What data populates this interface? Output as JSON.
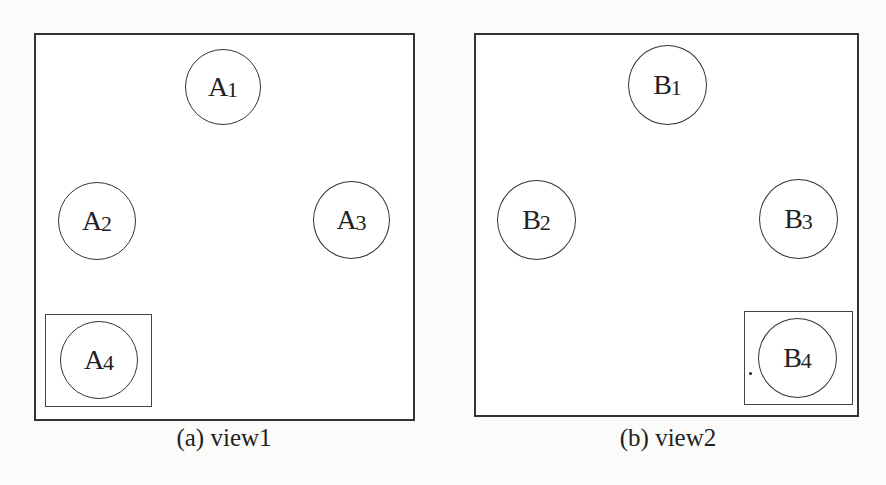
{
  "figure": {
    "views": [
      {
        "id": "view1",
        "caption": "(a) view1",
        "nodes": [
          {
            "letter": "A",
            "index": "1"
          },
          {
            "letter": "A",
            "index": "2"
          },
          {
            "letter": "A",
            "index": "3"
          },
          {
            "letter": "A",
            "index": "4",
            "highlighted": true
          }
        ]
      },
      {
        "id": "view2",
        "caption": "(b) view2",
        "nodes": [
          {
            "letter": "B",
            "index": "1"
          },
          {
            "letter": "B",
            "index": "2"
          },
          {
            "letter": "B",
            "index": "3"
          },
          {
            "letter": "B",
            "index": "4",
            "highlighted": true
          }
        ]
      }
    ]
  }
}
